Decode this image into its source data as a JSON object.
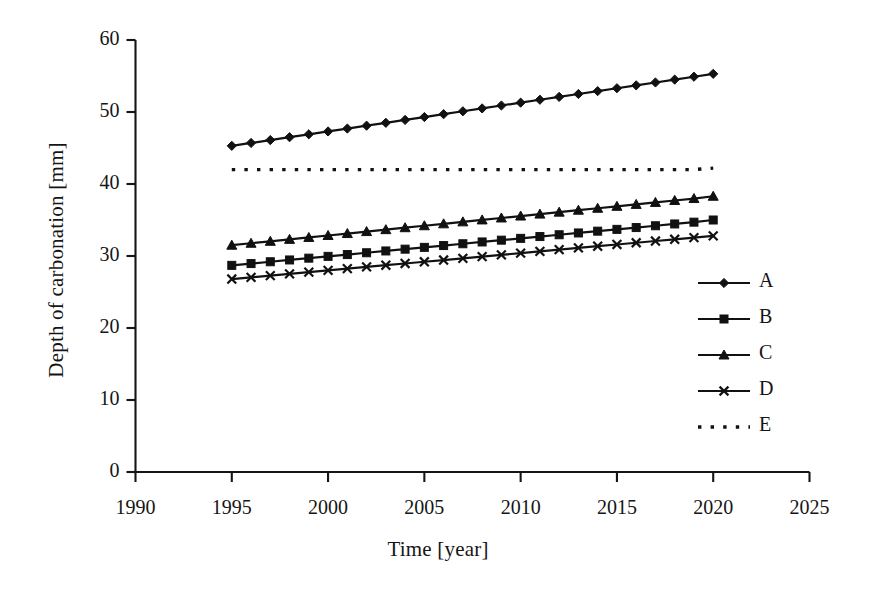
{
  "chart_data": {
    "type": "line",
    "title": "",
    "xlabel": "Time [year]",
    "ylabel": "Depth of carbonation [mm]",
    "xlim": [
      1990,
      2025
    ],
    "ylim": [
      0,
      60
    ],
    "xticks": [
      1990,
      1995,
      2000,
      2005,
      2010,
      2015,
      2020,
      2025
    ],
    "ytick_labels": [
      "0",
      "10",
      "20",
      "30",
      "40",
      "50",
      "60"
    ],
    "yticks": [
      0,
      10,
      20,
      30,
      40,
      50,
      60
    ],
    "grid": false,
    "legend_position": "center-right",
    "x": [
      1995,
      1996,
      1997,
      1998,
      1999,
      2000,
      2001,
      2002,
      2003,
      2004,
      2005,
      2006,
      2007,
      2008,
      2009,
      2010,
      2011,
      2012,
      2013,
      2014,
      2015,
      2016,
      2017,
      2018,
      2019,
      2020
    ],
    "series": [
      {
        "name": "A",
        "marker": "diamond",
        "linestyle": "solid",
        "color": "#111111",
        "values": [
          45.3,
          45.7,
          46.1,
          46.5,
          46.9,
          47.3,
          47.7,
          48.1,
          48.5,
          48.9,
          49.3,
          49.7,
          50.1,
          50.5,
          50.9,
          51.3,
          51.7,
          52.1,
          52.5,
          52.9,
          53.3,
          53.7,
          54.1,
          54.5,
          54.9,
          55.3
        ]
      },
      {
        "name": "B",
        "marker": "square",
        "linestyle": "solid",
        "color": "#111111",
        "values": [
          28.7,
          28.95,
          29.2,
          29.45,
          29.7,
          29.95,
          30.2,
          30.45,
          30.7,
          30.95,
          31.2,
          31.45,
          31.7,
          31.95,
          32.2,
          32.45,
          32.7,
          32.95,
          33.2,
          33.45,
          33.7,
          33.95,
          34.2,
          34.45,
          34.7,
          35.0
        ]
      },
      {
        "name": "C",
        "marker": "triangle",
        "linestyle": "solid",
        "color": "#111111",
        "values": [
          31.5,
          31.77,
          32.04,
          32.31,
          32.58,
          32.85,
          33.12,
          33.39,
          33.66,
          33.93,
          34.2,
          34.47,
          34.74,
          35.01,
          35.28,
          35.55,
          35.82,
          36.09,
          36.36,
          36.63,
          36.9,
          37.17,
          37.44,
          37.71,
          37.98,
          38.3
        ]
      },
      {
        "name": "D",
        "marker": "cross",
        "linestyle": "solid",
        "color": "#111111",
        "values": [
          26.8,
          27.04,
          27.28,
          27.52,
          27.76,
          28.0,
          28.24,
          28.48,
          28.72,
          28.96,
          29.2,
          29.44,
          29.68,
          29.92,
          30.16,
          30.4,
          30.64,
          30.88,
          31.12,
          31.36,
          31.6,
          31.84,
          32.08,
          32.32,
          32.56,
          32.8
        ]
      },
      {
        "name": "E",
        "marker": "none",
        "linestyle": "dotted",
        "color": "#111111",
        "values": [
          42.0,
          42.0,
          42.0,
          42.0,
          42.0,
          42.0,
          42.0,
          42.0,
          42.0,
          42.0,
          42.0,
          42.0,
          42.0,
          42.0,
          42.0,
          42.0,
          42.0,
          42.0,
          42.0,
          42.0,
          42.0,
          42.0,
          42.0,
          42.0,
          42.0,
          42.2
        ]
      }
    ]
  },
  "legend": {
    "entries": [
      {
        "label": "A",
        "marker": "diamond",
        "linestyle": "solid"
      },
      {
        "label": "B",
        "marker": "square",
        "linestyle": "solid"
      },
      {
        "label": "C",
        "marker": "triangle",
        "linestyle": "solid"
      },
      {
        "label": "D",
        "marker": "cross",
        "linestyle": "solid"
      },
      {
        "label": "E",
        "marker": "none",
        "linestyle": "dotted"
      }
    ]
  },
  "style": {
    "axis_color": "#151515",
    "background": "#ffffff",
    "ink": "#111111"
  }
}
